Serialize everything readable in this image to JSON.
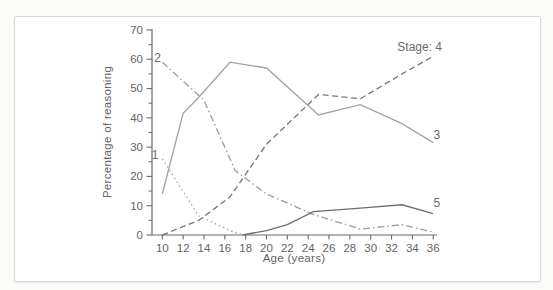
{
  "figure": {
    "background_color": "#fbfbf9",
    "frame_border_color": "#d8d8d6",
    "axis_color": "#6b6b6b",
    "text_color": "#646464"
  },
  "chart_data": {
    "type": "line",
    "title": "",
    "xlabel": "Age (years)",
    "ylabel": "Percentage of reasoning",
    "xlim": [
      9,
      36.4
    ],
    "ylim": [
      0,
      70
    ],
    "grid": false,
    "legend_position": "inline-labels",
    "x_ticks": [
      10,
      12,
      14,
      16,
      18,
      20,
      22,
      24,
      26,
      28,
      30,
      32,
      34,
      36
    ],
    "y_ticks": [
      0,
      10,
      20,
      30,
      40,
      50,
      60,
      70
    ],
    "y_minor_ticks": [
      5,
      15,
      25,
      35,
      45,
      55,
      65
    ],
    "series": [
      {
        "name": "Stage 1",
        "label": "1",
        "style": "dotted",
        "color": "#a8a8a8",
        "points": [
          [
            10,
            26
          ],
          [
            13.5,
            6.5
          ],
          [
            16.5,
            1.5
          ],
          [
            17.7,
            0
          ]
        ]
      },
      {
        "name": "Stage 2",
        "label": "2",
        "style": "dashdot",
        "color": "#9e9e9e",
        "points": [
          [
            10,
            59
          ],
          [
            14,
            46
          ],
          [
            17,
            22
          ],
          [
            20,
            14
          ],
          [
            24.5,
            7
          ],
          [
            29,
            2
          ],
          [
            33,
            3.5
          ],
          [
            36,
            1
          ]
        ]
      },
      {
        "name": "Stage 3",
        "label": "3",
        "style": "solid",
        "color": "#a4a4a4",
        "points": [
          [
            10,
            14
          ],
          [
            12,
            41.5
          ],
          [
            13.5,
            47
          ],
          [
            16.5,
            59
          ],
          [
            20,
            57
          ],
          [
            25,
            41
          ],
          [
            29,
            44.5
          ],
          [
            33,
            38
          ],
          [
            36,
            31.5
          ]
        ]
      },
      {
        "name": "Stage 4",
        "label": "Stage: 4",
        "style": "dashed",
        "color": "#787878",
        "points": [
          [
            10,
            0
          ],
          [
            13.5,
            5
          ],
          [
            16.5,
            13
          ],
          [
            20,
            31
          ],
          [
            25,
            48
          ],
          [
            29,
            46.5
          ],
          [
            33,
            55
          ],
          [
            36,
            61
          ]
        ]
      },
      {
        "name": "Stage 5",
        "label": "5",
        "style": "solid",
        "color": "#6e6e6e",
        "points": [
          [
            17.7,
            0
          ],
          [
            20,
            1.5
          ],
          [
            22,
            3.5
          ],
          [
            24.5,
            8
          ],
          [
            29,
            9.2
          ],
          [
            33,
            10.3
          ],
          [
            36,
            7.3
          ]
        ]
      }
    ],
    "annotations": [
      {
        "text": "1",
        "x": 9.3,
        "y": 27.2,
        "anchor": "middle",
        "size": 12
      },
      {
        "text": "2",
        "x": 9.55,
        "y": 60.6,
        "anchor": "middle",
        "size": 12
      },
      {
        "text": "3",
        "x": 36.35,
        "y": 34.0,
        "anchor": "middle",
        "size": 12
      },
      {
        "text": "5",
        "x": 36.35,
        "y": 10.8,
        "anchor": "middle",
        "size": 12
      },
      {
        "text": "Stage: 4",
        "x": 34.7,
        "y": 64.2,
        "anchor": "middle",
        "size": 12
      }
    ]
  }
}
